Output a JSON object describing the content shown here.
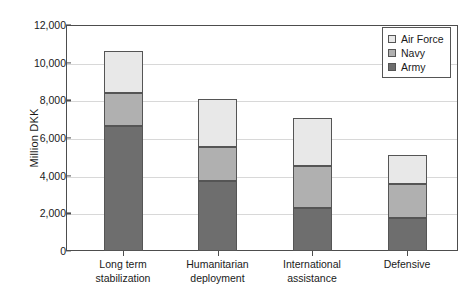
{
  "chart_data": {
    "type": "bar",
    "stacked": true,
    "title": "",
    "subtitle": "",
    "xlabel": "",
    "ylabel": "Million DKK",
    "ylim": [
      0,
      12000
    ],
    "ytick_labels": [
      "12,000",
      "10,000",
      "8,000",
      "6,000",
      "4,000",
      "2,000",
      "0"
    ],
    "ytick_values": [
      12000,
      10000,
      8000,
      6000,
      4000,
      2000,
      0
    ],
    "grid": true,
    "grid_axis": "y",
    "legend_position": "top-right",
    "categories": [
      "Long term stabilization",
      "Humanitarian deployment",
      "International assistance",
      "Defensive"
    ],
    "category_lines": [
      [
        "Long term",
        "stabilization"
      ],
      [
        "Humanitarian",
        "deployment"
      ],
      [
        "International",
        "assistance"
      ],
      [
        "Defensive",
        ""
      ]
    ],
    "series": [
      {
        "name": "Army",
        "color": "#6e6e6e",
        "values": [
          6650,
          3700,
          2300,
          1750
        ]
      },
      {
        "name": "Navy",
        "color": "#b0b0b0",
        "values": [
          1750,
          1800,
          2200,
          1800
        ]
      },
      {
        "name": "Air Force",
        "color": "#e8e8e8",
        "values": [
          2200,
          2550,
          2550,
          1550
        ]
      }
    ],
    "stack_order_bottom_to_top": [
      "Army",
      "Navy",
      "Air Force"
    ],
    "cumulative_tops": {
      "Army": [
        6650,
        3700,
        2300,
        1750
      ],
      "Navy": [
        8400,
        5500,
        4500,
        3550
      ],
      "Air Force": [
        10600,
        8050,
        7050,
        5100
      ]
    },
    "totals": [
      10600,
      8050,
      7050,
      5100
    ]
  },
  "legend": {
    "entries": [
      {
        "label": "Air Force",
        "color": "#e8e8e8"
      },
      {
        "label": "Navy",
        "color": "#b0b0b0"
      },
      {
        "label": "Army",
        "color": "#6e6e6e"
      }
    ]
  },
  "axis": {
    "y_title": "Million DKK"
  },
  "colors": {
    "axis_line": "#4d4d4d",
    "grid": "#d8d8d8",
    "text": "#1a1a1a",
    "bar_border": "#555555",
    "background": "#ffffff"
  }
}
